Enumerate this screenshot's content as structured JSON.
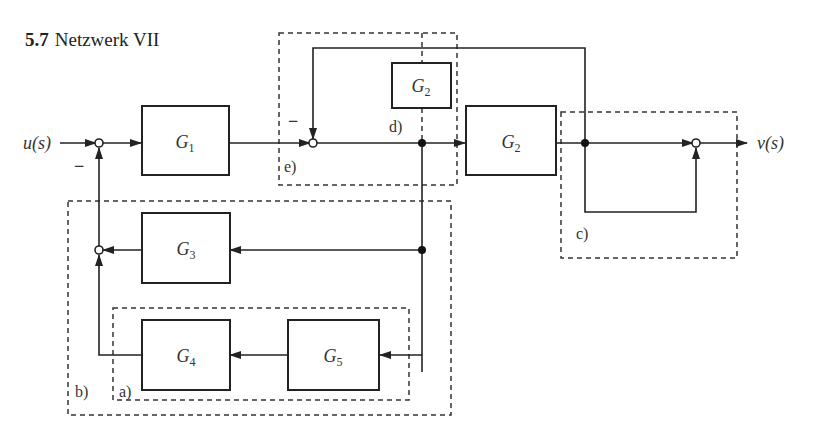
{
  "title": {
    "number": "5.7",
    "text": "Netzwerk VII"
  },
  "signals": {
    "input": "u(s)",
    "output": "v(s)"
  },
  "blocks": {
    "g1": {
      "name": "G",
      "sub": "1"
    },
    "g2_main": {
      "name": "G",
      "sub": "2"
    },
    "g2_d": {
      "name": "G",
      "sub": "2"
    },
    "g3": {
      "name": "G",
      "sub": "3"
    },
    "g4": {
      "name": "G",
      "sub": "4"
    },
    "g5": {
      "name": "G",
      "sub": "5"
    }
  },
  "regions": {
    "a": "a)",
    "b": "b)",
    "c": "c)",
    "d": "d)",
    "e": "e)"
  },
  "signs": {
    "sum1_minus": "−",
    "sum_e_minus": "−"
  },
  "colors": {
    "line": "#222222",
    "dashed": "#333333",
    "background": "#ffffff"
  }
}
